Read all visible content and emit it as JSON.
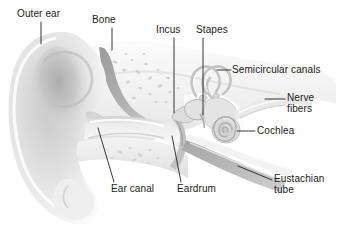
{
  "figure": {
    "background_color": "#ffffff",
    "text_color": "#1a1a1a",
    "leader_color": "#222222",
    "tissue_light": "#f2f2f2",
    "tissue_mid": "#d9d9d9",
    "tissue_dark": "#b3b3b3",
    "bone_shade": "#a8a8a8"
  },
  "labels": {
    "outer_ear": "Outer ear",
    "bone": "Bone",
    "incus": "Incus",
    "stapes": "Stapes",
    "semicircular_canals": "Semicircular canals",
    "nerve_fibers_line1": "Nerve",
    "nerve_fibers_line2": "fibers",
    "cochlea": "Cochlea",
    "ear_canal": "Ear canal",
    "eardrum": "Eardrum",
    "eustachian_line1": "Eustachian",
    "eustachian_line2": "tube"
  },
  "parts": [
    {
      "id": "outer-ear",
      "label": "Outer ear",
      "region": "outer ear"
    },
    {
      "id": "ear-canal",
      "label": "Ear canal",
      "region": "outer ear"
    },
    {
      "id": "eardrum",
      "label": "Eardrum",
      "region": "middle ear"
    },
    {
      "id": "bone",
      "label": "Bone",
      "region": "skull"
    },
    {
      "id": "incus",
      "label": "Incus",
      "region": "middle ear"
    },
    {
      "id": "stapes",
      "label": "Stapes",
      "region": "middle ear"
    },
    {
      "id": "semicircular-canals",
      "label": "Semicircular canals",
      "region": "inner ear"
    },
    {
      "id": "nerve-fibers",
      "label": "Nerve fibers",
      "region": "inner ear"
    },
    {
      "id": "cochlea",
      "label": "Cochlea",
      "region": "inner ear"
    },
    {
      "id": "eustachian-tube",
      "label": "Eustachian tube",
      "region": "middle ear"
    }
  ]
}
